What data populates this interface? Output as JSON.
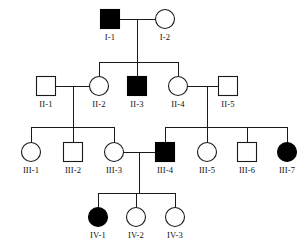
{
  "figure": {
    "kind": "pedigree-chart",
    "background_color": "#ffffff",
    "line_color": "#1a1a1a",
    "affected_fill_color": "#000000",
    "unaffected_fill_color": "#ffffff",
    "width": 308,
    "height": 243
  },
  "chart_data": {
    "type": "diagram",
    "title": "",
    "diagram_type": "pedigree",
    "generations": [
      "I",
      "II",
      "III",
      "IV"
    ],
    "symbol_legend": {
      "square": "male",
      "circle": "female",
      "filled": "affected",
      "open": "unaffected"
    },
    "individuals": [
      {
        "id": "I-1",
        "label": "I-1",
        "sex": "male",
        "affected": true,
        "generation": "I",
        "cx": 110,
        "cy": 19,
        "label_x": 110,
        "label_y": 40
      },
      {
        "id": "I-2",
        "label": "I-2",
        "sex": "female",
        "affected": false,
        "generation": "I",
        "cx": 165,
        "cy": 19,
        "label_x": 165,
        "label_y": 40
      },
      {
        "id": "II-1",
        "label": "II-1",
        "sex": "male",
        "affected": false,
        "generation": "II",
        "cx": 46,
        "cy": 86,
        "label_x": 46,
        "label_y": 107
      },
      {
        "id": "II-2",
        "label": "II-2",
        "sex": "female",
        "affected": false,
        "generation": "II",
        "cx": 99,
        "cy": 86,
        "label_x": 99,
        "label_y": 107
      },
      {
        "id": "II-3",
        "label": "II-3",
        "sex": "male",
        "affected": true,
        "generation": "II",
        "cx": 137,
        "cy": 86,
        "label_x": 137,
        "label_y": 107
      },
      {
        "id": "II-4",
        "label": "II-4",
        "sex": "female",
        "affected": false,
        "generation": "II",
        "cx": 178,
        "cy": 86,
        "label_x": 178,
        "label_y": 107
      },
      {
        "id": "II-5",
        "label": "II-5",
        "sex": "male",
        "affected": false,
        "generation": "II",
        "cx": 228,
        "cy": 86,
        "label_x": 228,
        "label_y": 107
      },
      {
        "id": "III-1",
        "label": "III-1",
        "sex": "female",
        "affected": false,
        "generation": "III",
        "cx": 31,
        "cy": 152,
        "label_x": 31,
        "label_y": 173
      },
      {
        "id": "III-2",
        "label": "III-2",
        "sex": "male",
        "affected": false,
        "generation": "III",
        "cx": 73,
        "cy": 152,
        "label_x": 73,
        "label_y": 173
      },
      {
        "id": "III-3",
        "label": "III-3",
        "sex": "female",
        "affected": false,
        "generation": "III",
        "cx": 114,
        "cy": 152,
        "label_x": 114,
        "label_y": 173
      },
      {
        "id": "III-4",
        "label": "III-4",
        "sex": "male",
        "affected": true,
        "generation": "III",
        "cx": 165,
        "cy": 152,
        "label_x": 165,
        "label_y": 173
      },
      {
        "id": "III-5",
        "label": "III-5",
        "sex": "female",
        "affected": false,
        "generation": "III",
        "cx": 207,
        "cy": 152,
        "label_x": 207,
        "label_y": 173
      },
      {
        "id": "III-6",
        "label": "III-6",
        "sex": "male",
        "affected": false,
        "generation": "III",
        "cx": 247,
        "cy": 152,
        "label_x": 247,
        "label_y": 173
      },
      {
        "id": "III-7",
        "label": "III-7",
        "sex": "female",
        "affected": true,
        "generation": "III",
        "cx": 287,
        "cy": 152,
        "label_x": 287,
        "label_y": 173
      },
      {
        "id": "IV-1",
        "label": "IV-1",
        "sex": "female",
        "affected": true,
        "generation": "IV",
        "cx": 98,
        "cy": 217,
        "label_x": 98,
        "label_y": 238
      },
      {
        "id": "IV-2",
        "label": "IV-2",
        "sex": "female",
        "affected": false,
        "generation": "IV",
        "cx": 136,
        "cy": 217,
        "label_x": 136,
        "label_y": 238
      },
      {
        "id": "IV-3",
        "label": "IV-3",
        "sex": "female",
        "affected": false,
        "generation": "IV",
        "cx": 175,
        "cy": 217,
        "label_x": 175,
        "label_y": 238
      }
    ],
    "matings": [
      {
        "id": "I-1xI-2",
        "partners": [
          "I-1",
          "I-2"
        ],
        "children": [
          "II-2",
          "II-3",
          "II-4"
        ]
      },
      {
        "id": "II-1xII-2",
        "partners": [
          "II-1",
          "II-2"
        ],
        "children": [
          "III-1",
          "III-2",
          "III-3"
        ]
      },
      {
        "id": "II-4xII-5",
        "partners": [
          "II-4",
          "II-5"
        ],
        "children": [
          "III-4",
          "III-5",
          "III-6",
          "III-7"
        ]
      },
      {
        "id": "III-3xIII-4",
        "partners": [
          "III-3",
          "III-4"
        ],
        "children": [
          "IV-1",
          "IV-2",
          "IV-3"
        ]
      }
    ],
    "connector_lines": [
      {
        "name": "mate-line-I",
        "type": "horizontal",
        "x1": 120,
        "x2": 155,
        "y": 19
      },
      {
        "name": "descent-line-I",
        "type": "vertical",
        "x": 137,
        "y1": 19,
        "y2": 62
      },
      {
        "name": "sibship-bar-II",
        "type": "horizontal",
        "x1": 99,
        "x2": 178,
        "y": 62
      },
      {
        "name": "drop-II-2",
        "type": "vertical",
        "x": 99,
        "y1": 62,
        "y2": 77
      },
      {
        "name": "drop-II-3",
        "type": "vertical",
        "x": 137,
        "y1": 62,
        "y2": 77
      },
      {
        "name": "drop-II-4",
        "type": "vertical",
        "x": 178,
        "y1": 62,
        "y2": 77
      },
      {
        "name": "mate-line-II-1-2",
        "type": "horizontal",
        "x1": 56,
        "x2": 90,
        "y": 86
      },
      {
        "name": "descent-line-II-1-2",
        "type": "vertical",
        "x": 73,
        "y1": 86,
        "y2": 127
      },
      {
        "name": "sibship-bar-III-a",
        "type": "horizontal",
        "x1": 31,
        "x2": 114,
        "y": 127
      },
      {
        "name": "drop-III-1",
        "type": "vertical",
        "x": 31,
        "y1": 127,
        "y2": 143
      },
      {
        "name": "drop-III-2",
        "type": "vertical",
        "x": 73,
        "y1": 127,
        "y2": 143
      },
      {
        "name": "drop-III-3",
        "type": "vertical",
        "x": 114,
        "y1": 127,
        "y2": 143
      },
      {
        "name": "mate-line-II-4-5",
        "type": "horizontal",
        "x1": 187,
        "x2": 218,
        "y": 86
      },
      {
        "name": "descent-line-II-4-5",
        "type": "vertical",
        "x": 207,
        "y1": 86,
        "y2": 127
      },
      {
        "name": "sibship-bar-III-b",
        "type": "horizontal",
        "x1": 165,
        "x2": 287,
        "y": 127
      },
      {
        "name": "drop-III-4",
        "type": "vertical",
        "x": 165,
        "y1": 127,
        "y2": 143
      },
      {
        "name": "drop-III-5",
        "type": "vertical",
        "x": 207,
        "y1": 127,
        "y2": 143
      },
      {
        "name": "drop-III-6",
        "type": "vertical",
        "x": 247,
        "y1": 127,
        "y2": 143
      },
      {
        "name": "drop-III-7",
        "type": "vertical",
        "x": 287,
        "y1": 127,
        "y2": 143
      },
      {
        "name": "mate-line-III-3-4",
        "type": "horizontal",
        "x1": 123,
        "x2": 155,
        "y": 152
      },
      {
        "name": "descent-line-III",
        "type": "vertical",
        "x": 139,
        "y1": 152,
        "y2": 193
      },
      {
        "name": "sibship-bar-IV",
        "type": "horizontal",
        "x1": 98,
        "x2": 175,
        "y": 193
      },
      {
        "name": "drop-IV-1",
        "type": "vertical",
        "x": 98,
        "y1": 193,
        "y2": 208
      },
      {
        "name": "drop-IV-2",
        "type": "vertical",
        "x": 136,
        "y1": 193,
        "y2": 208
      },
      {
        "name": "drop-IV-3",
        "type": "vertical",
        "x": 175,
        "y1": 193,
        "y2": 208
      }
    ],
    "symbol_size": {
      "square_side": 19,
      "circle_radius": 9.5
    }
  }
}
